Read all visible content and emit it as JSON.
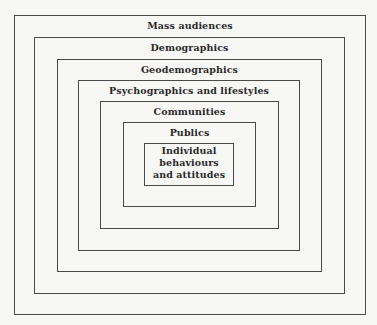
{
  "diagram": {
    "type": "nested-boxes",
    "layers": [
      {
        "label": "Mass audiences"
      },
      {
        "label": "Demographics"
      },
      {
        "label": "Geodemographics"
      },
      {
        "label": "Psychographics and lifestyles"
      },
      {
        "label": "Communities"
      },
      {
        "label": "Publics"
      },
      {
        "label": "Individual behaviours and attitudes"
      }
    ]
  },
  "colors": {
    "background": "#f7f7f5",
    "line": "#4a4a4a",
    "text": "#2a2a2a"
  }
}
